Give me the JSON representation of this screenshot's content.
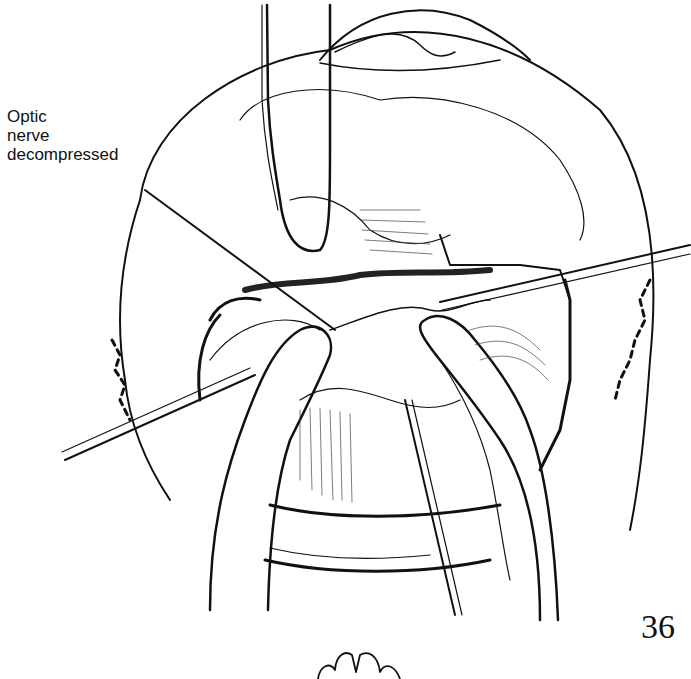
{
  "figure": {
    "annotation": {
      "lines": [
        "Optic",
        "nerve",
        "decompressed"
      ]
    },
    "page_number": "36",
    "ink_color": "#111111",
    "paper_color": "#ffffff"
  }
}
